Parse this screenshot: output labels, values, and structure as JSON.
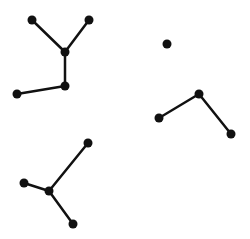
{
  "diagram": {
    "type": "graph",
    "background": "#ffffff",
    "stroke_color": "#111111",
    "node_color": "#111111",
    "edge_width": 2.5,
    "node_radius": 4.5,
    "nodes": [
      {
        "id": "n1",
        "x": 32,
        "y": 20
      },
      {
        "id": "n2",
        "x": 89,
        "y": 20
      },
      {
        "id": "n3",
        "x": 65,
        "y": 52
      },
      {
        "id": "n4",
        "x": 65,
        "y": 86
      },
      {
        "id": "n5",
        "x": 17,
        "y": 94
      },
      {
        "id": "n6",
        "x": 167,
        "y": 44
      },
      {
        "id": "n7",
        "x": 199,
        "y": 94
      },
      {
        "id": "n8",
        "x": 159,
        "y": 118
      },
      {
        "id": "n9",
        "x": 231,
        "y": 134
      },
      {
        "id": "n10",
        "x": 88,
        "y": 143
      },
      {
        "id": "n11",
        "x": 24,
        "y": 183
      },
      {
        "id": "n12",
        "x": 49,
        "y": 191
      },
      {
        "id": "n13",
        "x": 73,
        "y": 224
      }
    ],
    "edges": [
      {
        "from": "n1",
        "to": "n3"
      },
      {
        "from": "n2",
        "to": "n3"
      },
      {
        "from": "n3",
        "to": "n4"
      },
      {
        "from": "n4",
        "to": "n5"
      },
      {
        "from": "n7",
        "to": "n8"
      },
      {
        "from": "n7",
        "to": "n9"
      },
      {
        "from": "n10",
        "to": "n12"
      },
      {
        "from": "n11",
        "to": "n12"
      },
      {
        "from": "n12",
        "to": "n13"
      }
    ]
  }
}
